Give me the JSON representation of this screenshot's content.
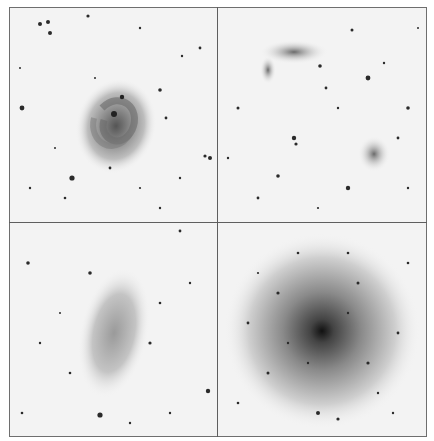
{
  "figure": {
    "layout": "2x2 grid",
    "rendering": "inverted grayscale (negative) sky survey images",
    "colors": {
      "background": "#f3f3f3",
      "border": "#6e6e6e",
      "stars": "#1a1a1a"
    },
    "panels": [
      {
        "id": "top-left",
        "object": "face-on spiral galaxy with two arms and bright compact nucleus"
      },
      {
        "id": "top-right",
        "object": "two small diffuse galaxies: elongated irregular (upper left) and compact irregular (lower right)"
      },
      {
        "id": "bottom-left",
        "object": "faint diffuse elongated irregular dwarf galaxy"
      },
      {
        "id": "bottom-right",
        "object": "large resolved globular star cluster with dense core"
      }
    ]
  }
}
